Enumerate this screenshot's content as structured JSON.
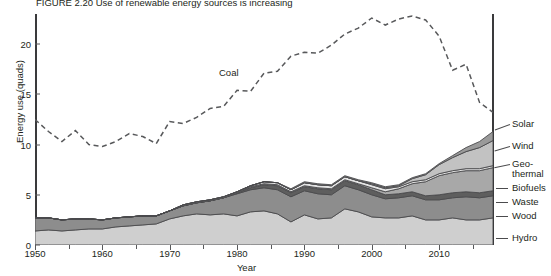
{
  "figure": {
    "title": "FIGURE 2.20  Use of renewable energy sources is increasing",
    "xlabel": "Year",
    "ylabel": "Energy use (quads)",
    "coal_label": "Coal"
  },
  "axes": {
    "yticks": [
      0,
      5,
      10,
      15,
      20
    ],
    "xticks": [
      1950,
      1960,
      1970,
      1980,
      1990,
      2000,
      2010
    ],
    "xminor": [
      1955,
      1965,
      1975,
      1985,
      1995,
      2005,
      2015
    ],
    "xlim": [
      1950,
      2018
    ],
    "ylim": [
      0,
      23
    ]
  },
  "legend": [
    {
      "label": "Solar",
      "key": "solar"
    },
    {
      "label": "Wind",
      "key": "wind"
    },
    {
      "label": "Geo-",
      "key": "geothermal_1"
    },
    {
      "label": "thermal",
      "key": "geothermal_2"
    },
    {
      "label": "Biofuels",
      "key": "biofuels"
    },
    {
      "label": "Waste",
      "key": "waste"
    },
    {
      "label": "Wood",
      "key": "wood"
    },
    {
      "label": "Hydro",
      "key": "hydro"
    }
  ],
  "colors": {
    "hydro": "#cfcfcf",
    "wood": "#8d8d8d",
    "waste": "#5e5e5e",
    "biofuels": "#a8a8a8",
    "geothermal": "#e4e4e4",
    "wind": "#c2c2c2",
    "solar": "#9a9a9a",
    "coal_line": "#58595b",
    "axis": "#3a3a3c",
    "stroke": "#4b4b4d"
  },
  "chart_data": {
    "type": "area",
    "title": "FIGURE 2.20  Use of renewable energy sources is increasing",
    "xlabel": "Year",
    "ylabel": "Energy use (quads)",
    "xlim": [
      1950,
      2018
    ],
    "ylim": [
      0,
      23
    ],
    "grid": false,
    "legend_position": "right",
    "x": [
      1950,
      1952,
      1954,
      1956,
      1958,
      1960,
      1962,
      1964,
      1966,
      1968,
      1970,
      1972,
      1974,
      1976,
      1978,
      1980,
      1982,
      1984,
      1986,
      1988,
      1990,
      1992,
      1994,
      1996,
      1998,
      2000,
      2002,
      2004,
      2006,
      2008,
      2010,
      2012,
      2014,
      2016,
      2018
    ],
    "series": [
      {
        "name": "Hydro",
        "values": [
          1.4,
          1.5,
          1.4,
          1.5,
          1.6,
          1.6,
          1.8,
          1.9,
          2.0,
          2.1,
          2.6,
          2.9,
          3.1,
          3.0,
          3.1,
          2.9,
          3.3,
          3.4,
          3.1,
          2.3,
          3.0,
          2.6,
          2.7,
          3.6,
          3.3,
          2.8,
          2.7,
          2.7,
          2.9,
          2.5,
          2.5,
          2.7,
          2.5,
          2.5,
          2.7
        ]
      },
      {
        "name": "Wood",
        "values": [
          1.3,
          1.2,
          1.1,
          1.1,
          1.0,
          0.9,
          0.9,
          0.9,
          0.9,
          0.8,
          0.8,
          1.0,
          1.1,
          1.4,
          1.6,
          2.2,
          2.2,
          2.3,
          2.4,
          2.5,
          2.4,
          2.5,
          2.3,
          2.3,
          2.2,
          2.2,
          1.9,
          2.0,
          2.0,
          2.0,
          2.0,
          2.0,
          2.3,
          2.2,
          2.2
        ]
      },
      {
        "name": "Waste",
        "values": [
          0.0,
          0.0,
          0.0,
          0.0,
          0.0,
          0.0,
          0.0,
          0.0,
          0.0,
          0.0,
          0.0,
          0.0,
          0.0,
          0.0,
          0.0,
          0.1,
          0.2,
          0.3,
          0.4,
          0.4,
          0.4,
          0.5,
          0.5,
          0.5,
          0.5,
          0.5,
          0.4,
          0.4,
          0.4,
          0.4,
          0.5,
          0.5,
          0.5,
          0.5,
          0.5
        ]
      },
      {
        "name": "Biofuels",
        "values": [
          0.0,
          0.0,
          0.0,
          0.0,
          0.0,
          0.0,
          0.0,
          0.0,
          0.0,
          0.0,
          0.0,
          0.0,
          0.0,
          0.0,
          0.0,
          0.0,
          0.1,
          0.1,
          0.1,
          0.1,
          0.1,
          0.1,
          0.1,
          0.1,
          0.1,
          0.2,
          0.3,
          0.5,
          0.8,
          1.4,
          1.9,
          2.0,
          2.1,
          2.2,
          2.3
        ]
      },
      {
        "name": "Geothermal",
        "values": [
          0.0,
          0.0,
          0.0,
          0.0,
          0.0,
          0.0,
          0.0,
          0.0,
          0.0,
          0.0,
          0.0,
          0.1,
          0.1,
          0.1,
          0.1,
          0.1,
          0.1,
          0.2,
          0.2,
          0.2,
          0.3,
          0.3,
          0.3,
          0.3,
          0.3,
          0.3,
          0.3,
          0.2,
          0.2,
          0.2,
          0.2,
          0.2,
          0.2,
          0.2,
          0.2
        ]
      },
      {
        "name": "Wind",
        "values": [
          0.0,
          0.0,
          0.0,
          0.0,
          0.0,
          0.0,
          0.0,
          0.0,
          0.0,
          0.0,
          0.0,
          0.0,
          0.0,
          0.0,
          0.0,
          0.0,
          0.0,
          0.0,
          0.0,
          0.0,
          0.0,
          0.0,
          0.0,
          0.0,
          0.0,
          0.1,
          0.1,
          0.1,
          0.3,
          0.5,
          0.9,
          1.3,
          1.7,
          2.1,
          2.5
        ]
      },
      {
        "name": "Solar",
        "values": [
          0.0,
          0.0,
          0.0,
          0.0,
          0.0,
          0.0,
          0.0,
          0.0,
          0.0,
          0.0,
          0.0,
          0.0,
          0.0,
          0.0,
          0.0,
          0.0,
          0.0,
          0.0,
          0.0,
          0.1,
          0.1,
          0.1,
          0.1,
          0.1,
          0.1,
          0.1,
          0.1,
          0.1,
          0.1,
          0.1,
          0.1,
          0.2,
          0.4,
          0.6,
          0.9
        ]
      }
    ],
    "overlay_line": {
      "name": "Coal",
      "style": "dashed",
      "x": [
        1950,
        1952,
        1954,
        1956,
        1958,
        1960,
        1962,
        1964,
        1966,
        1968,
        1970,
        1972,
        1974,
        1976,
        1978,
        1980,
        1982,
        1984,
        1986,
        1988,
        1990,
        1992,
        1994,
        1996,
        1998,
        2000,
        2002,
        2004,
        2006,
        2008,
        2010,
        2012,
        2014,
        2016,
        2018
      ],
      "values": [
        12.5,
        11.3,
        10.3,
        11.4,
        10.0,
        9.8,
        10.3,
        11.1,
        10.8,
        10.1,
        12.3,
        12.1,
        12.7,
        13.6,
        13.8,
        15.4,
        15.3,
        17.1,
        17.3,
        18.8,
        19.2,
        19.1,
        19.9,
        21.0,
        21.6,
        22.6,
        21.9,
        22.5,
        22.8,
        22.4,
        20.8,
        17.4,
        18.0,
        14.2,
        13.2
      ]
    }
  }
}
